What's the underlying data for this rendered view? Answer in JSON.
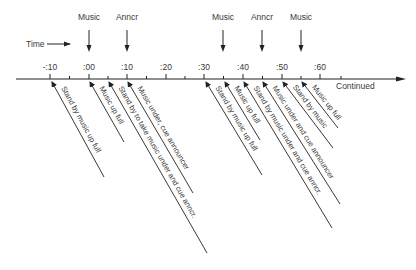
{
  "timeline": {
    "time_label": "Time",
    "continued_label": "Continued",
    "ticks": [
      {
        "label": "-:10",
        "x": 50
      },
      {
        "label": ":00",
        "x": 89
      },
      {
        "label": ":10",
        "x": 127
      },
      {
        "label": ":20",
        "x": 166
      },
      {
        "label": ":30",
        "x": 204
      },
      {
        "label": ":40",
        "x": 243
      },
      {
        "label": ":50",
        "x": 282
      },
      {
        "label": ":60",
        "x": 320
      }
    ],
    "top_markers": [
      {
        "label": "Music",
        "x": 89
      },
      {
        "label": "Anncr",
        "x": 127
      },
      {
        "label": "Music",
        "x": 223
      },
      {
        "label": "Anncr",
        "x": 262
      },
      {
        "label": "Music",
        "x": 301
      }
    ],
    "cues": [
      {
        "label": "Stand by music up full",
        "x0": 52,
        "x1": 104,
        "y1": 177
      },
      {
        "label": "Music up full",
        "x0": 90,
        "x1": 124,
        "y1": 142
      },
      {
        "label": "Stand by to take music under and cue anncr.",
        "x0": 109,
        "x1": 207,
        "y1": 253
      },
      {
        "label": "Music under, cue announcer",
        "x0": 128,
        "x1": 193,
        "y1": 193
      },
      {
        "label": "Stand by music up full",
        "x0": 206,
        "x1": 262,
        "y1": 175
      },
      {
        "label": "Music up full",
        "x0": 225,
        "x1": 260,
        "y1": 140
      },
      {
        "label": "Stand by music under and cue anncr.",
        "x0": 244,
        "x1": 332,
        "y1": 228
      },
      {
        "label": "Music under and cue announcer",
        "x0": 263,
        "x1": 340,
        "y1": 204
      },
      {
        "label": "Stand by music",
        "x0": 283,
        "x1": 333,
        "y1": 148
      },
      {
        "label": "Music up full",
        "x0": 302,
        "x1": 338,
        "y1": 128
      }
    ]
  }
}
